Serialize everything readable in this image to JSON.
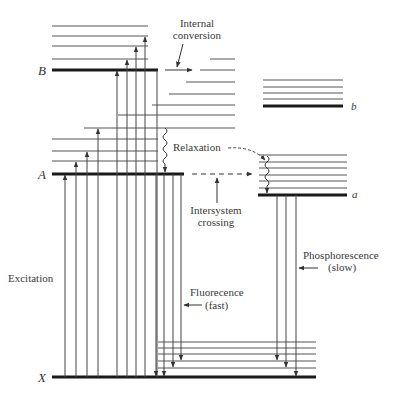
{
  "diagram": {
    "states": {
      "B": {
        "label": "B",
        "y": 70
      },
      "A": {
        "label": "A",
        "y": 174
      },
      "X": {
        "label": "X",
        "y": 377
      },
      "b": {
        "label": "b",
        "y": 106
      },
      "a": {
        "label": "a",
        "y": 195
      }
    },
    "labels": {
      "internal_conversion_line1": "Internal",
      "internal_conversion_line2": "conversion",
      "relaxation": "Relaxation",
      "intersystem_line1": "Intersystem",
      "intersystem_line2": "crossing",
      "excitation": "Excitation",
      "fluorescence_line1": "Fluorecence",
      "fluorescence_line2": "(fast)",
      "phosphorescence_line1": "Phosphorescence",
      "phosphorescence_line2": "(slow)"
    },
    "processes": [
      "Excitation",
      "Internal conversion",
      "Relaxation",
      "Intersystem crossing",
      "Fluorecence (fast)",
      "Phosphorescence (slow)"
    ],
    "colors": {
      "line": "#444444",
      "main_level": "#1a1a1a",
      "text": "#3a3a3a"
    }
  }
}
